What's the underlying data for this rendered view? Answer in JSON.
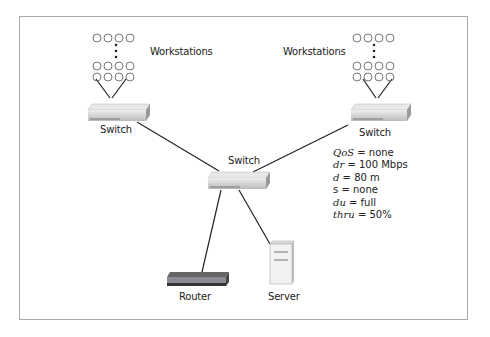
{
  "diagram": {
    "labels": {
      "workstations_left": "Workstations",
      "workstations_right": "Workstations",
      "switch_left": "Switch",
      "switch_right": "Switch",
      "switch_center": "Switch",
      "router": "Router",
      "server": "Server"
    },
    "link_parameters": [
      {
        "key": "QoS",
        "value": "= none"
      },
      {
        "key": "dr",
        "value": "= 100 Mbps"
      },
      {
        "key": "d",
        "value": "= 80 m"
      },
      {
        "key": "s",
        "value": "= none"
      },
      {
        "key": "du",
        "value": "= full"
      },
      {
        "key": "thru",
        "value": "= 50%"
      }
    ]
  }
}
